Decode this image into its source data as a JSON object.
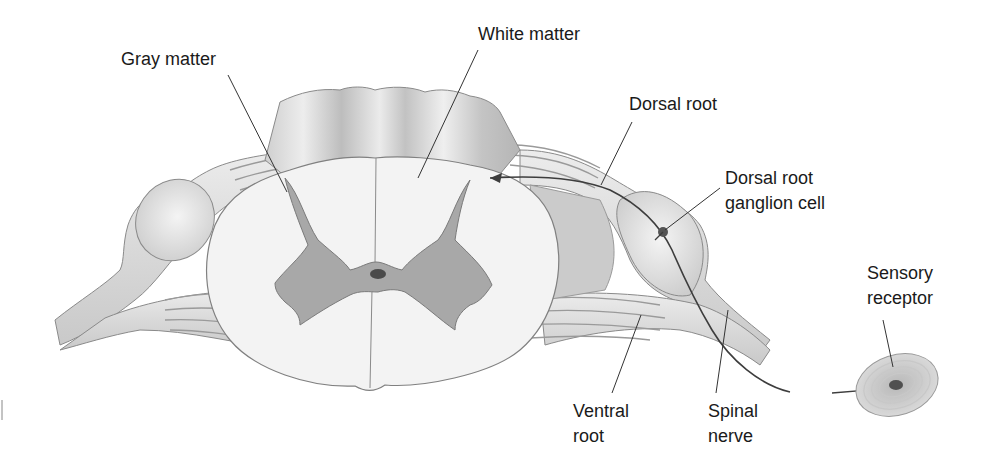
{
  "diagram": {
    "labels": {
      "gray_matter": "Gray matter",
      "white_matter": "White matter",
      "dorsal_root": "Dorsal root",
      "dorsal_root_ganglion_cell": {
        "line1": "Dorsal root",
        "line2": "ganglion cell"
      },
      "sensory_receptor": {
        "line1": "Sensory",
        "line2": "receptor"
      },
      "ventral_root": {
        "line1": "Ventral",
        "line2": "root"
      },
      "spinal_nerve": {
        "line1": "Spinal",
        "line2": "nerve"
      }
    },
    "colors": {
      "background": "#ffffff",
      "white_matter_fill": "#f2f2f2",
      "gray_matter_fill": "#a9a9a9",
      "nerve_fill": "#e4e4e4",
      "outline": "#777777",
      "leader_line": "#333333",
      "axon": "#444444"
    }
  }
}
